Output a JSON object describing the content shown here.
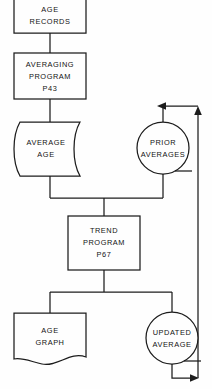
{
  "diagram": {
    "background_color": "#fefefe",
    "line_color": "#1c1c1c",
    "text_color": "#131313",
    "nodes": [
      {
        "id": "age-records",
        "shape": "document",
        "lines": [
          "AGE",
          "RECORDS"
        ],
        "line1": "AGE",
        "line2": "RECORDS",
        "line3": ""
      },
      {
        "id": "averaging-program",
        "shape": "process",
        "lines": [
          "AVERAGING",
          "PROGRAM",
          "P43"
        ],
        "line1": "AVERAGING",
        "line2": "PROGRAM",
        "line3": "P43"
      },
      {
        "id": "average-age",
        "shape": "direct-access-storage",
        "lines": [
          "AVERAGE",
          "AGE"
        ],
        "line1": "AVERAGE",
        "line2": "AGE",
        "line3": ""
      },
      {
        "id": "prior-averages",
        "shape": "magnetic-tape",
        "lines": [
          "PRIOR",
          "AVERAGES"
        ],
        "line1": "PRIOR",
        "line2": "AVERAGES",
        "line3": ""
      },
      {
        "id": "trend-program",
        "shape": "process",
        "lines": [
          "TREND",
          "PROGRAM",
          "P67"
        ],
        "line1": "TREND",
        "line2": "PROGRAM",
        "line3": "P67"
      },
      {
        "id": "age-graph",
        "shape": "document",
        "lines": [
          "AGE",
          "GRAPH"
        ],
        "line1": "AGE",
        "line2": "GRAPH",
        "line3": ""
      },
      {
        "id": "updated-average",
        "shape": "magnetic-tape",
        "lines": [
          "UPDATED",
          "AVERAGE"
        ],
        "line1": "UPDATED",
        "line2": "AVERAGE",
        "line3": ""
      }
    ],
    "edges": [
      {
        "id": "e1",
        "from": "age-records",
        "to": "averaging-program",
        "arrow": false
      },
      {
        "id": "e2",
        "from": "averaging-program",
        "to": "average-age",
        "arrow": false
      },
      {
        "id": "e3",
        "from": "average-age",
        "to": "trend-program",
        "arrow": false
      },
      {
        "id": "e4",
        "from": "prior-averages",
        "to": "trend-program",
        "arrow": false
      },
      {
        "id": "e5",
        "from": "trend-program",
        "to": "age-graph",
        "arrow": false
      },
      {
        "id": "e6",
        "from": "trend-program",
        "to": "updated-average",
        "arrow": false
      },
      {
        "id": "e7",
        "from": "updated-average",
        "to": "prior-averages",
        "arrow": true
      }
    ]
  }
}
